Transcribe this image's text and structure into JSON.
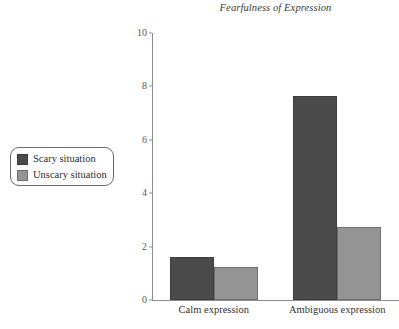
{
  "chart_data": {
    "type": "bar",
    "title": "Fearfulness of Expression",
    "xlabel": "",
    "ylabel": "",
    "ylim": [
      0,
      10
    ],
    "yticks": [
      0,
      2,
      4,
      6,
      8,
      10
    ],
    "ytick_labels": [
      "0",
      "2",
      "4",
      "6",
      "8",
      "10"
    ],
    "grid": false,
    "legend_position": "left-outside",
    "categories": [
      "Calm expression",
      "Ambiguous expression"
    ],
    "series": [
      {
        "name": "Scary situation",
        "color": "#4a4a4a",
        "values": [
          1.6,
          7.65
        ]
      },
      {
        "name": "Unscary situation",
        "color": "#949494",
        "values": [
          1.25,
          2.75
        ]
      }
    ]
  },
  "legend": {
    "items": [
      {
        "label": "Scary situation"
      },
      {
        "label": "Unscary situation"
      }
    ]
  }
}
